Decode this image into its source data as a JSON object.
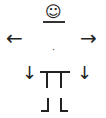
{
  "figure": {
    "head": "☺",
    "left_arrow": "←",
    "right_arrow": "→",
    "center_dot": "·",
    "down_arrow_left": "↓",
    "down_arrow_right": "↓"
  }
}
